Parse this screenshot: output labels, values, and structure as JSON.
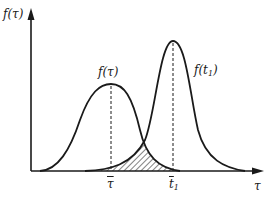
{
  "diagram": {
    "type": "probability-density-curves",
    "axes": {
      "y_label": "f(τ)",
      "x_label": "τ"
    },
    "curves": [
      {
        "name": "f(τ)",
        "label": "f(τ)",
        "peak_marker": "τ̄"
      },
      {
        "name": "f(t1)",
        "label_main": "f(t",
        "label_sub": "1",
        "label_close": ")",
        "peak_marker_main": "t̄",
        "peak_marker_sub": "1"
      }
    ],
    "markers": {
      "tau_bar": "τ",
      "t1_bar_main": "t",
      "t1_bar_sub": "1"
    },
    "shaded_region": "overlap between f(τ) and f(t1)",
    "colors": {
      "line": "#1a1a1a",
      "background": "#ffffff"
    }
  }
}
